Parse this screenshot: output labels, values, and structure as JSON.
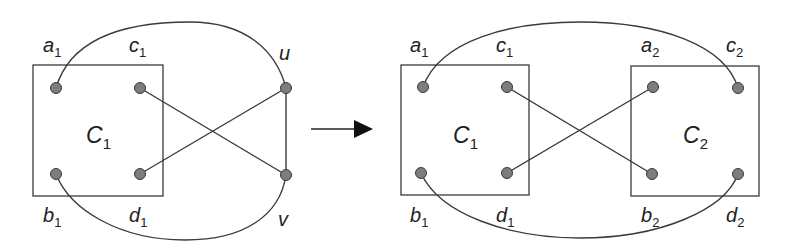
{
  "figure": {
    "colors": {
      "stroke": "#3a3a3a",
      "node_fill": "#7d7d7d",
      "text": "#222222",
      "background": "#ffffff"
    },
    "left": {
      "component": {
        "name": "C",
        "sub": "1"
      },
      "vertices": [
        {
          "id": "a1",
          "name": "a",
          "sub": "1"
        },
        {
          "id": "c1",
          "name": "c",
          "sub": "1"
        },
        {
          "id": "b1",
          "name": "b",
          "sub": "1"
        },
        {
          "id": "d1",
          "name": "d",
          "sub": "1"
        },
        {
          "id": "u",
          "name": "u",
          "sub": ""
        },
        {
          "id": "v",
          "name": "v",
          "sub": ""
        }
      ],
      "edges": [
        [
          "a1",
          "u"
        ],
        [
          "b1",
          "v"
        ],
        [
          "c1",
          "v"
        ],
        [
          "d1",
          "u"
        ],
        [
          "u",
          "v"
        ]
      ]
    },
    "arrow": {
      "direction": "right",
      "icon": "arrow-right-icon"
    },
    "right": {
      "components": [
        {
          "name": "C",
          "sub": "1"
        },
        {
          "name": "C",
          "sub": "2"
        }
      ],
      "vertices": [
        {
          "id": "a1",
          "name": "a",
          "sub": "1"
        },
        {
          "id": "c1",
          "name": "c",
          "sub": "1"
        },
        {
          "id": "b1",
          "name": "b",
          "sub": "1"
        },
        {
          "id": "d1",
          "name": "d",
          "sub": "1"
        },
        {
          "id": "a2",
          "name": "a",
          "sub": "2"
        },
        {
          "id": "c2",
          "name": "c",
          "sub": "2"
        },
        {
          "id": "b2",
          "name": "b",
          "sub": "2"
        },
        {
          "id": "d2",
          "name": "d",
          "sub": "2"
        }
      ],
      "edges": [
        [
          "a1",
          "c2"
        ],
        [
          "b1",
          "d2"
        ],
        [
          "c1",
          "b2"
        ],
        [
          "d1",
          "a2"
        ]
      ]
    }
  }
}
